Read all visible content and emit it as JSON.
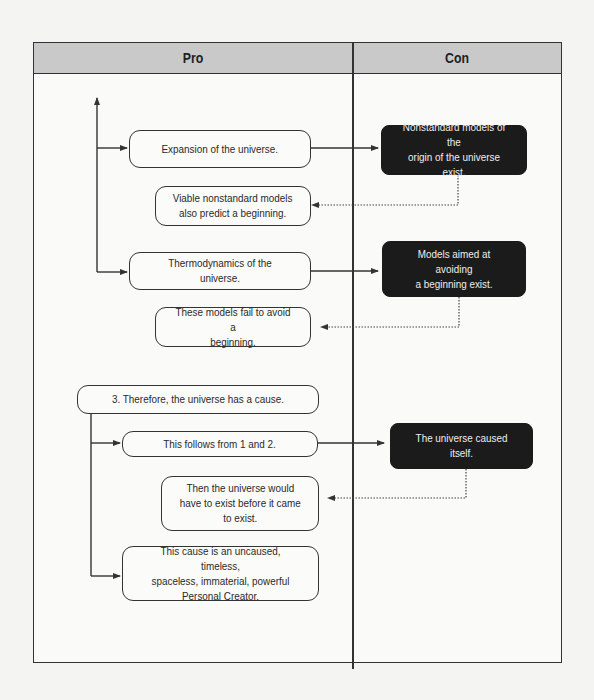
{
  "table": {
    "columns": [
      {
        "label": "Pro"
      },
      {
        "label": "Con"
      }
    ]
  },
  "pro": {
    "expansion": "Expansion of the universe.",
    "viable": "Viable nonstandard models\nalso predict a beginning.",
    "thermo": "Thermodynamics of the universe.",
    "fail": "These models fail to avoid a\nbeginning.",
    "therefore": "3. Therefore, the universe has a cause.",
    "follows": "This follows from 1 and 2.",
    "exist_before": "Then the universe would\nhave to exist before it came\nto exist.",
    "creator": "This cause is an uncaused, timeless,\nspaceless, immaterial, powerful\nPersonal Creator."
  },
  "con": {
    "nonstandard": "Nonstandard models of the\norigin of the universe exist.",
    "avoiding": "Models aimed at avoiding\na beginning exist.",
    "caused_itself": "The universe caused itself."
  },
  "colors": {
    "header_bg": "#c9c9c9",
    "dark_box": "#1b1b1b",
    "line": "#333333"
  }
}
